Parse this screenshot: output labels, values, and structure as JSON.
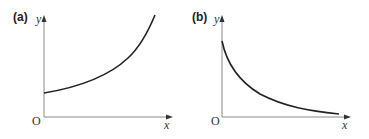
{
  "panels": [
    {
      "label": "(a)",
      "y_axis_label": "y",
      "x_axis_label": "x",
      "origin_label": "O",
      "curve": "increasing exponential growth, positive y-intercept"
    },
    {
      "label": "(b)",
      "y_axis_label": "y",
      "x_axis_label": "x",
      "origin_label": "O",
      "curve": "decreasing exponential decay, approaching x-axis"
    }
  ],
  "colors": {
    "axis": "#888888",
    "curve": "#222222",
    "text": "#222222"
  }
}
